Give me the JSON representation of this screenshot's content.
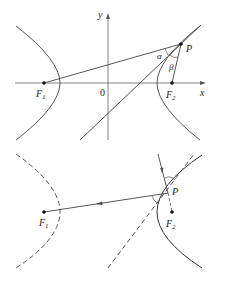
{
  "top_figure": {
    "labels": {
      "y_axis": "y",
      "x_axis": "x",
      "origin": "0",
      "focus1": "F",
      "focus1_sub": "1",
      "focus2": "F",
      "focus2_sub": "2",
      "point": "P",
      "angle_alpha": "α",
      "angle_beta": "β"
    }
  },
  "bottom_figure": {
    "labels": {
      "focus1": "F",
      "focus1_sub": "1",
      "focus2": "F",
      "focus2_sub": "2",
      "point": "P"
    }
  },
  "colors": {
    "line": "#333333",
    "curve": "#444444"
  }
}
